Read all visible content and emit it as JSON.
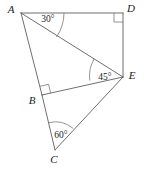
{
  "figure": {
    "stroke_color": "#5f5f5f",
    "mark_color": "#7a7a7a",
    "background_color": "#ffffff",
    "vertices": [
      {
        "id": "A",
        "label": "A",
        "x": 21,
        "y": 13,
        "label_x": 11,
        "label_y": 13
      },
      {
        "id": "D",
        "label": "D",
        "x": 123,
        "y": 13,
        "label_x": 131,
        "label_y": 12
      },
      {
        "id": "E",
        "label": "E",
        "x": 123,
        "y": 77,
        "label_x": 132,
        "label_y": 79
      },
      {
        "id": "B",
        "label": "B",
        "x": 42,
        "y": 95,
        "label_x": 32,
        "label_y": 104
      },
      {
        "id": "C",
        "label": "C",
        "x": 55,
        "y": 150,
        "label_x": 54,
        "label_y": 163
      }
    ],
    "segments": [
      {
        "name": "segment-AD",
        "from": "A",
        "to": "D"
      },
      {
        "name": "segment-DE",
        "from": "D",
        "to": "E"
      },
      {
        "name": "segment-AE",
        "from": "A",
        "to": "E"
      },
      {
        "name": "segment-AB",
        "from": "A",
        "to": "B"
      },
      {
        "name": "segment-BC",
        "from": "B",
        "to": "C"
      },
      {
        "name": "segment-BE",
        "from": "B",
        "to": "E"
      },
      {
        "name": "segment-CE",
        "from": "C",
        "to": "E"
      }
    ],
    "angles": [
      {
        "name": "angle-A",
        "vertex": "A",
        "value": "30°",
        "label_x": 48,
        "label_y": 22
      },
      {
        "name": "angle-E",
        "vertex": "E",
        "value": "45°",
        "label_x": 105,
        "label_y": 80
      },
      {
        "name": "angle-C",
        "vertex": "C",
        "value": "60°",
        "label_x": 61,
        "label_y": 138
      }
    ],
    "right_angles": [
      {
        "name": "right-angle-D",
        "vertex": "D"
      },
      {
        "name": "right-angle-B",
        "vertex": "B"
      }
    ]
  }
}
